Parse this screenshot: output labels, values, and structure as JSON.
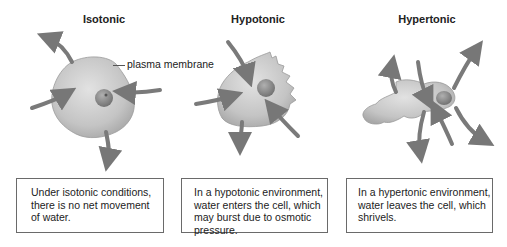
{
  "panels": [
    {
      "id": "isotonic",
      "title": "Isotonic",
      "description_lines": [
        "Under isotonic conditions,",
        "there is no net movement",
        "of water."
      ]
    },
    {
      "id": "hypotonic",
      "title": "Hypotonic",
      "description_lines": [
        "In a hypotonic environment,",
        "water enters the cell, which",
        "may burst due to osmotic",
        "pressure."
      ]
    },
    {
      "id": "hypertonic",
      "title": "Hypertonic",
      "description_lines": [
        "In a hypertonic environment,",
        "water leaves the cell, which",
        "shrivels."
      ]
    }
  ],
  "annotations": {
    "membrane_label": "plasma membrane"
  },
  "colors": {
    "cell_fill": "#c8c8c8",
    "nucleus_fill": "#8a8a8a",
    "arrow_fill": "#7a7a7a",
    "box_border": "#6a6a6a"
  }
}
